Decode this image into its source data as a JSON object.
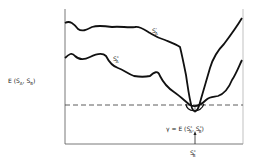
{
  "diagram": {
    "ylabel": "E (S",
    "ylabel_sub_a": "A",
    "ylabel_mid": ", S",
    "ylabel_sub_b": "B",
    "ylabel_end": ")",
    "curve_upper_label": "S",
    "curve_upper_sup": "'",
    "curve_upper_sub": "A",
    "curve_lower_label": "S",
    "curve_lower_sup": "*",
    "curve_lower_sub": "A",
    "gamma_label": "γ = E (S",
    "gamma_sup1": "*",
    "gamma_sub1": "A",
    "gamma_mid": ", S",
    "gamma_sup2": "*",
    "gamma_sub2": "B",
    "gamma_end": ")",
    "x_marker": "S",
    "x_marker_sup": "*",
    "x_marker_sub": "B"
  }
}
